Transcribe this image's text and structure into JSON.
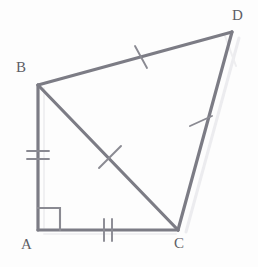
{
  "figure": {
    "background_color": "#fdfdfd",
    "stroke_color": "#7c7c85",
    "tick_color": "#8a8a92",
    "ghost_color": "#ebebee",
    "label_color": "#5e5e66",
    "vertices": [
      {
        "name": "A",
        "label": "A",
        "x": 38,
        "y": 230,
        "label_x": 21,
        "label_y": 237
      },
      {
        "name": "B",
        "label": "B",
        "x": 38,
        "y": 85,
        "label_x": 16,
        "label_y": 60
      },
      {
        "name": "C",
        "label": "C",
        "x": 178,
        "y": 230,
        "label_x": 174,
        "label_y": 236
      },
      {
        "name": "D",
        "label": "D",
        "x": 232,
        "y": 32,
        "label_x": 232,
        "label_y": 8
      }
    ],
    "segments": [
      {
        "name": "segment-AB",
        "from": "A",
        "to": "B",
        "ticks": 2,
        "tick_label": "double-tick"
      },
      {
        "name": "segment-AC",
        "from": "A",
        "to": "C",
        "ticks": 2,
        "tick_label": "double-tick"
      },
      {
        "name": "segment-BC",
        "from": "B",
        "to": "C",
        "ticks": 1,
        "tick_label": "single-tick"
      },
      {
        "name": "segment-BD",
        "from": "B",
        "to": "D",
        "ticks": 1,
        "tick_label": "single-tick"
      },
      {
        "name": "segment-CD",
        "from": "C",
        "to": "D",
        "ticks": 1,
        "tick_label": "single-tick"
      }
    ],
    "right_angle": {
      "at": "A",
      "size": 22,
      "label": "right-angle-marker"
    }
  }
}
